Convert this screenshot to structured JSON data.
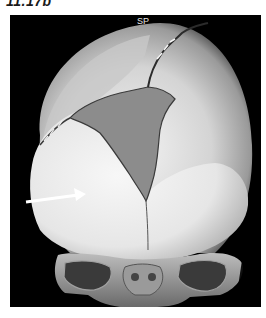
{
  "figure": {
    "label": "11.17b",
    "image_label": "SP",
    "annotation": "arrow",
    "colors": {
      "background": "#000000",
      "bone": "#d9d9d9",
      "fontanelle": "#8c8c8c",
      "arrow": "#ffffff"
    }
  }
}
